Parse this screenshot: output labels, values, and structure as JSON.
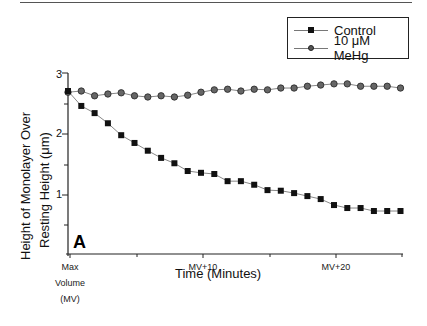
{
  "chart_data": {
    "type": "line",
    "title": "",
    "panel_label": "A",
    "xlabel": "Time (Minutes)",
    "ylabel_line1": "Height of Monolayer Over",
    "ylabel_line2": "Resting Height (μm)",
    "ylim": [
      0,
      3
    ],
    "yticks": [
      1,
      2,
      3
    ],
    "xlim": [
      0,
      30
    ],
    "xtick_labels": [
      {
        "x": 0,
        "label": "Max Volume (MV)"
      },
      {
        "x": 10,
        "label": "MV+10"
      },
      {
        "x": 20,
        "label": "MV+20"
      }
    ],
    "grid": false,
    "legend_position": "top-right",
    "x": [
      0,
      1,
      2,
      3,
      4,
      5,
      6,
      7,
      8,
      9,
      10,
      11,
      12,
      13,
      14,
      15,
      16,
      17,
      18,
      19,
      20,
      21,
      22,
      23,
      24,
      25
    ],
    "series": [
      {
        "name": "Control",
        "marker": "square",
        "values": [
          2.73,
          2.48,
          2.36,
          2.19,
          1.99,
          1.86,
          1.73,
          1.61,
          1.52,
          1.39,
          1.36,
          1.34,
          1.22,
          1.22,
          1.16,
          1.07,
          1.06,
          1.02,
          0.97,
          0.92,
          0.82,
          0.77,
          0.77,
          0.72,
          0.72,
          0.72
        ]
      },
      {
        "name": "10 μM MeHg",
        "marker": "circle",
        "values": [
          2.71,
          2.73,
          2.65,
          2.68,
          2.7,
          2.65,
          2.63,
          2.65,
          2.63,
          2.66,
          2.71,
          2.75,
          2.76,
          2.73,
          2.76,
          2.75,
          2.78,
          2.78,
          2.81,
          2.83,
          2.85,
          2.85,
          2.81,
          2.81,
          2.81,
          2.78
        ]
      }
    ]
  },
  "legend": {
    "control": "Control",
    "mehg": "10 μM MeHg"
  },
  "axes": {
    "y_tick_1": "1",
    "y_tick_2": "2",
    "y_tick_3": "3",
    "x_max_line1": "Max",
    "x_max_line2": "Volume",
    "x_max_line3": "(MV)",
    "x_mv10": "MV+10",
    "x_mv20": "MV+20"
  }
}
